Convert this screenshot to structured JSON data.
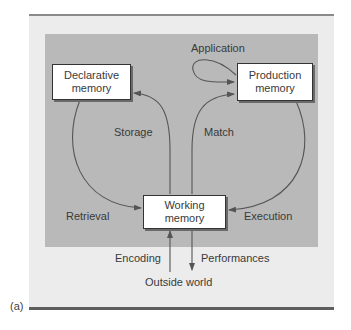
{
  "figure": {
    "caption": "(a)",
    "colors": {
      "outer_panel": "#ececec",
      "inner_panel": "#b9b9b9",
      "node_fill": "#ffffff",
      "node_border": "#333333",
      "arrow": "#555555",
      "text": "#3a3a3a",
      "rule": "#5e5e5e"
    }
  },
  "nodes": {
    "declarative": {
      "line1": "Declarative",
      "line2": "memory"
    },
    "production": {
      "line1": "Production",
      "line2": "memory"
    },
    "working": {
      "line1": "Working",
      "line2": "memory"
    }
  },
  "edges": {
    "application": "Application",
    "storage": "Storage",
    "match": "Match",
    "retrieval": "Retrieval",
    "execution": "Execution",
    "encoding": "Encoding",
    "performances": "Performances"
  },
  "external": {
    "outside_world": "Outside world"
  }
}
